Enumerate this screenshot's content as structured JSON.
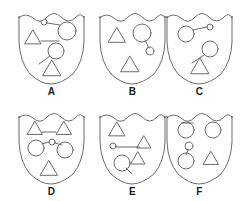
{
  "figure": {
    "kind": "shield-crest-grid",
    "background_color": "#ffffff",
    "stroke_color": "#6b6b6b",
    "label_color": "#1a1a1a",
    "rows": 2,
    "columns": 3
  },
  "shields": [
    {
      "label": "A",
      "position": {
        "x": 11,
        "y": 6
      },
      "shapes": [
        {
          "name": "triangle-upper-left",
          "type": "triangle",
          "cx": 22,
          "cy": 31,
          "size": 16
        },
        {
          "name": "line-from-triangle-right",
          "type": "line",
          "x1": 30,
          "y1": 35,
          "x2": 48,
          "y2": 35
        },
        {
          "name": "small-circle-top",
          "type": "circle",
          "cx": 33,
          "cy": 16,
          "r": 3
        },
        {
          "name": "line-small-to-large-circle",
          "type": "line",
          "x1": 36,
          "y1": 17,
          "x2": 49,
          "y2": 19
        },
        {
          "name": "large-circle-top-right",
          "type": "circle",
          "cx": 56,
          "cy": 25,
          "r": 9
        },
        {
          "name": "circle-middle",
          "type": "circle",
          "cx": 45,
          "cy": 45,
          "r": 8
        },
        {
          "name": "line-circle-to-lower-left",
          "type": "line",
          "x1": 39,
          "y1": 50,
          "x2": 28,
          "y2": 58
        },
        {
          "name": "triangle-lower-center",
          "type": "triangle",
          "cx": 41,
          "cy": 62,
          "size": 18
        }
      ]
    },
    {
      "label": "B",
      "position": {
        "x": 92,
        "y": 6
      },
      "shapes": [
        {
          "name": "triangle-upper-left",
          "type": "triangle",
          "cx": 25,
          "cy": 29,
          "size": 17
        },
        {
          "name": "large-circle-top-right",
          "type": "circle",
          "cx": 50,
          "cy": 27,
          "r": 9
        },
        {
          "name": "line-circle-to-small-circle",
          "type": "line",
          "x1": 53,
          "y1": 34,
          "x2": 57,
          "y2": 42
        },
        {
          "name": "small-circle-right",
          "type": "circle",
          "cx": 58,
          "cy": 45,
          "r": 4
        },
        {
          "name": "triangle-lower-center",
          "type": "triangle",
          "cx": 38,
          "cy": 58,
          "size": 18
        }
      ]
    },
    {
      "label": "C",
      "position": {
        "x": 159,
        "y": 6
      },
      "shapes": [
        {
          "name": "large-circle-upper-left",
          "type": "circle",
          "cx": 27,
          "cy": 28,
          "r": 8
        },
        {
          "name": "line-large-to-small-circle",
          "type": "line",
          "x1": 34,
          "y1": 24,
          "x2": 48,
          "y2": 21
        },
        {
          "name": "small-circle-upper-right",
          "type": "circle",
          "cx": 51,
          "cy": 21,
          "r": 3
        },
        {
          "name": "circle-middle-right",
          "type": "circle",
          "cx": 51,
          "cy": 43,
          "r": 8
        },
        {
          "name": "line-circle-to-triangle",
          "type": "line",
          "x1": 45,
          "y1": 49,
          "x2": 33,
          "y2": 57
        },
        {
          "name": "triangle-lower-center",
          "type": "triangle",
          "cx": 41,
          "cy": 60,
          "size": 18
        }
      ]
    },
    {
      "label": "D",
      "position": {
        "x": 11,
        "y": 106
      },
      "shapes": [
        {
          "name": "triangle-upper-left",
          "type": "triangle",
          "cx": 24,
          "cy": 22,
          "size": 15
        },
        {
          "name": "line-from-upper-triangle",
          "type": "line",
          "x1": 31,
          "y1": 26,
          "x2": 45,
          "y2": 26
        },
        {
          "name": "triangle-upper-right",
          "type": "triangle",
          "cx": 53,
          "cy": 22,
          "size": 15
        },
        {
          "name": "circle-middle-left",
          "type": "circle",
          "cx": 25,
          "cy": 42,
          "r": 8
        },
        {
          "name": "line-left-circle-to-small",
          "type": "line",
          "x1": 31,
          "y1": 38,
          "x2": 38,
          "y2": 36
        },
        {
          "name": "small-circle-center",
          "type": "circle",
          "cx": 41,
          "cy": 36,
          "r": 3
        },
        {
          "name": "line-small-to-right-circle",
          "type": "line",
          "x1": 44,
          "y1": 37,
          "x2": 51,
          "y2": 39
        },
        {
          "name": "circle-middle-right",
          "type": "circle",
          "cx": 54,
          "cy": 44,
          "r": 8
        },
        {
          "name": "triangle-lower-center",
          "type": "triangle",
          "cx": 38,
          "cy": 62,
          "size": 17
        }
      ]
    },
    {
      "label": "E",
      "position": {
        "x": 92,
        "y": 106
      },
      "shapes": [
        {
          "name": "triangle-upper-left",
          "type": "triangle",
          "cx": 25,
          "cy": 23,
          "size": 16
        },
        {
          "name": "small-circle-middle-left",
          "type": "circle",
          "cx": 21,
          "cy": 40,
          "r": 3
        },
        {
          "name": "line-small-circle-to-triangle",
          "type": "line",
          "x1": 24,
          "y1": 41,
          "x2": 47,
          "y2": 41
        },
        {
          "name": "triangle-middle-right",
          "type": "triangle",
          "cx": 52,
          "cy": 36,
          "size": 14
        },
        {
          "name": "triangle-lower-right",
          "type": "triangle",
          "cx": 46,
          "cy": 52,
          "size": 14
        },
        {
          "name": "circle-lower-left",
          "type": "circle",
          "cx": 30,
          "cy": 57,
          "r": 8
        },
        {
          "name": "line-from-lower-circle",
          "type": "line",
          "x1": 34,
          "y1": 62,
          "x2": 40,
          "y2": 68
        }
      ]
    },
    {
      "label": "F",
      "position": {
        "x": 159,
        "y": 106
      },
      "shapes": [
        {
          "name": "line-above-upper-left-circle",
          "type": "line",
          "x1": 22,
          "y1": 17,
          "x2": 34,
          "y2": 17
        },
        {
          "name": "circle-upper-left",
          "type": "circle",
          "cx": 27,
          "cy": 24,
          "r": 8
        },
        {
          "name": "circle-upper-right",
          "type": "circle",
          "cx": 54,
          "cy": 24,
          "r": 8
        },
        {
          "name": "small-circle-center",
          "type": "circle",
          "cx": 30,
          "cy": 40,
          "r": 4
        },
        {
          "name": "line-small-to-lower-circle",
          "type": "line",
          "x1": 29,
          "y1": 44,
          "x2": 27,
          "y2": 49
        },
        {
          "name": "circle-lower-left",
          "type": "circle",
          "cx": 27,
          "cy": 55,
          "r": 8
        },
        {
          "name": "triangle-lower-right",
          "type": "triangle",
          "cx": 52,
          "cy": 52,
          "size": 15
        }
      ]
    }
  ]
}
